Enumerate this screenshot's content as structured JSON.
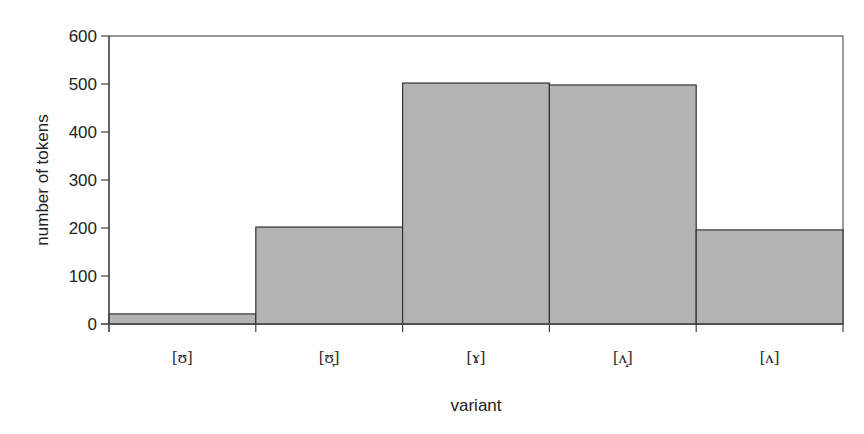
{
  "chart_data": {
    "type": "bar",
    "title": "",
    "xlabel": "variant",
    "ylabel": "number of tokens",
    "categories": [
      "[ʊ]",
      "[ʊ̞]",
      "[ɤ]",
      "[ʌ̝]",
      "[ʌ]"
    ],
    "values": [
      21,
      202,
      502,
      498,
      196
    ],
    "ylim": [
      0,
      600
    ],
    "yticks": [
      0,
      100,
      200,
      300,
      400,
      500,
      600
    ],
    "grid": false,
    "legend": null,
    "bar_color": "#b3b3b3",
    "bar_edge_color": "#333333"
  }
}
